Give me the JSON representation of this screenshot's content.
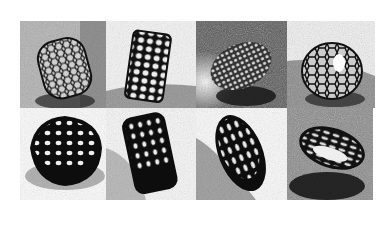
{
  "figure": {
    "layout": {
      "rows": 2,
      "columns": 4
    },
    "panels": [
      {
        "id": 1,
        "subject": "lattice ring, upright, gray textured background",
        "bg": "#8a8a8a",
        "obj": "#1a1a1a",
        "style": "open"
      },
      {
        "id": 2,
        "subject": "cylindrical lattice bracelet, tilted, white background with shadow",
        "bg": "#d8d8d8",
        "obj": "#111111",
        "style": "cells"
      },
      {
        "id": 3,
        "subject": "dense honeycomb lattice ring, dark background",
        "bg": "#444444",
        "obj": "#888888",
        "style": "dense"
      },
      {
        "id": 4,
        "subject": "open Voronoi lattice ring, gray background",
        "bg": "#9a9a9a",
        "obj": "#1a1a1a",
        "style": "open"
      },
      {
        "id": 5,
        "subject": "dark Voronoi lattice dome ring, light background",
        "bg": "#f0f0f0",
        "obj": "#0d0d0d",
        "style": "dark"
      },
      {
        "id": 6,
        "subject": "dark Voronoi lattice cylinder, tilted, light background",
        "bg": "#e4e4e4",
        "obj": "#0d0d0d",
        "style": "dark"
      },
      {
        "id": 7,
        "subject": "dark lattice bracelet, angled, white background with shadow",
        "bg": "#eeeeee",
        "obj": "#0d0d0d",
        "style": "dark"
      },
      {
        "id": 8,
        "subject": "lattice ring lying flat, gray background with shadow",
        "bg": "#7a7a7a",
        "obj": "#1a1a1a",
        "style": "open"
      }
    ]
  }
}
